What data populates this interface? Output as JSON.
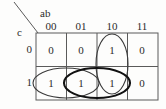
{
  "figure": {
    "type": "karnaugh-map",
    "row_variable_label": "c",
    "col_variable_label": "ab",
    "column_headers": [
      "00",
      "01",
      "10",
      "11"
    ],
    "row_headers": [
      "0",
      "1"
    ],
    "cells": [
      [
        "0",
        "0",
        "1",
        "0"
      ],
      [
        "1",
        "1",
        "1",
        "0"
      ]
    ],
    "groups": [
      {
        "name": "group-vertical-col10",
        "style": "thin"
      },
      {
        "name": "group-row1-col00-col01",
        "style": "thin"
      },
      {
        "name": "group-row1-col01-col10",
        "style": "bold"
      }
    ],
    "colors": {
      "grid_line": "#5a5a5a",
      "text": "#2b2b2b",
      "group_thin": "#3a3a3a",
      "group_bold": "#111111",
      "background": "#fdfdfc"
    }
  }
}
